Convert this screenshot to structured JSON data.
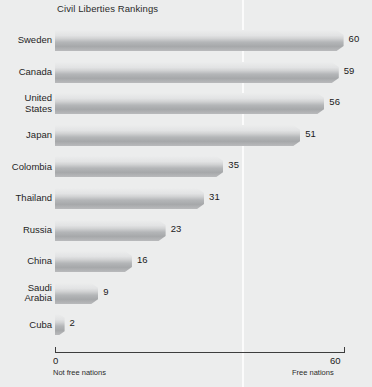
{
  "chart_data": {
    "type": "bar",
    "orientation": "horizontal",
    "title": "Civil Liberties Rankings",
    "xlabel": "",
    "ylabel": "",
    "xlim": [
      0,
      60
    ],
    "grid": true,
    "legend": false,
    "categories": [
      "Sweden",
      "Canada",
      "United\nStates",
      "Japan",
      "Colombia",
      "Thailand",
      "Russia",
      "China",
      "Saudi\nArabia",
      "Cuba"
    ],
    "values": [
      60,
      59,
      56,
      51,
      35,
      31,
      23,
      16,
      9,
      2
    ],
    "value_labels": [
      "60",
      "59",
      "56",
      "51",
      "35",
      "31",
      "23",
      "16",
      "9",
      "2"
    ],
    "axis": {
      "ticks": [
        0,
        60
      ],
      "tick_labels": [
        "0",
        "60"
      ],
      "left_caption": "Not free nations",
      "right_caption": "Free nations"
    },
    "colors": {
      "background": "#eceded",
      "bar_top": "#eceded",
      "bar_mid": "#d2d3d4",
      "bar_bottom": "#a6a8aa",
      "bar_edge": "#9a9c9e",
      "axis": "#3d3d3d",
      "gridline": "#fbfbfb",
      "text": "#1a1a1a"
    }
  }
}
